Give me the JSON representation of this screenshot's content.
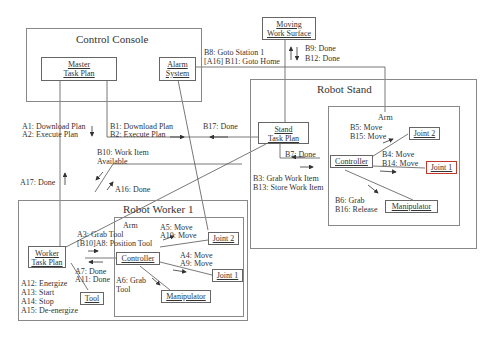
{
  "diagram": {
    "colors": {
      "line": "#555555",
      "frame": "#888888",
      "text": "#333333",
      "accent_red": "#c0392b",
      "accent_green": "#6a8a3a"
    },
    "containers": {
      "control_console": {
        "title": "Control Console"
      },
      "robot_stand": {
        "title": "Robot Stand",
        "arm_title": "Arm"
      },
      "robot_worker": {
        "title": "Robot Worker 1",
        "arm_title": "Arm"
      }
    },
    "nodes": {
      "master_task_plan": {
        "line1": "Master",
        "line2": "Task Plan"
      },
      "alarm_system": {
        "line1": "Alarm",
        "line2": "System"
      },
      "moving_work_surface": {
        "line1": "Moving",
        "line2": "Work Surface"
      },
      "stand_task_plan": {
        "line1": "Stand",
        "line2": "Task Plan"
      },
      "stand_controller": {
        "label": "Controller"
      },
      "stand_joint2": {
        "label": "Joint 2"
      },
      "stand_joint1": {
        "label": "Joint 1"
      },
      "stand_manipulator": {
        "label": "Manipulator"
      },
      "worker_task_plan": {
        "line1": "Worker",
        "line2": "Task Plan"
      },
      "worker_tool": {
        "label": "Tool"
      },
      "worker_controller": {
        "label": "Controller"
      },
      "worker_joint2": {
        "label": "Joint 2"
      },
      "worker_joint1": {
        "label": "Joint 1"
      },
      "worker_manipulator": {
        "label": "Manipulator"
      }
    },
    "messages": {
      "a1": "A1: Download Plan",
      "a2": "A2: Execute Plan",
      "b1": "B1: Download Plan",
      "b2": "B2: Execute Plan",
      "b17": "B17: Done",
      "b8": "B8: Goto Station 1",
      "b11": "[A16] B11: Goto Home",
      "b9": "B9: Done",
      "b12": "B12: Done",
      "b10a": "B10: Work Item",
      "b10b": "Available",
      "a17": "A17: Done",
      "a16": "A16: Done",
      "b7": "B7: Done",
      "b3": "B3: Grab Work Item",
      "b13": "B13: Store Work Item",
      "b5": "B5: Move",
      "b15": "B15: Move",
      "b4": "B4: Move",
      "b14": "B14: Move",
      "b6": "B6: Grab",
      "b16": "B16: Release",
      "a3": "A3: Grab Tool",
      "a8": "[B10]A8: Position Tool",
      "a5": "A5: Move",
      "a10": "A10: Move",
      "a4": "A4: Move",
      "a9": "A9: Move",
      "a7": "A7: Done",
      "a11": "A11: Done",
      "a6a": "A6: Grab",
      "a6b": "Tool",
      "a12": "A12: Energize",
      "a13": "A13: Start",
      "a14": "A14: Stop",
      "a15": "A15: De-energize"
    }
  }
}
